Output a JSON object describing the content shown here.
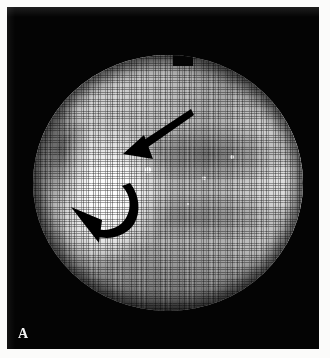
{
  "figure": {
    "panel_letter": "A",
    "caption_visible": false,
    "modality": "fiberoptic-endoscopy",
    "plate_background_color": "#040404",
    "page_background_color": "#fbfbfa"
  },
  "image_field": {
    "shape": "circle",
    "description": "Fiberoptic endoscopic view with visible honeycomb fiber-bundle mosaic",
    "top_notch": true,
    "tones": {
      "darkest": "#181818",
      "mid": "#a9a9a9",
      "bright_rim": "#ffffff",
      "hotspot": "#ffffff"
    }
  },
  "annotations": {
    "straight_arrow": {
      "name": "straight-arrow",
      "color": "#000000",
      "direction": "down-left",
      "tip": {
        "x": 131,
        "y": 149
      },
      "tail": {
        "x": 191,
        "y": 109
      }
    },
    "curved_arrow": {
      "name": "curved-arrow",
      "color": "#000000",
      "direction": "counter-clockwise, head up-left",
      "tip": {
        "x": 74,
        "y": 206
      },
      "tail": {
        "x": 130,
        "y": 189
      }
    }
  },
  "specular_points": [
    {
      "x": 148,
      "y": 170,
      "r": 3.0
    },
    {
      "x": 204,
      "y": 178,
      "r": 2.2
    },
    {
      "x": 232,
      "y": 157,
      "r": 2.0
    },
    {
      "x": 120,
      "y": 232,
      "r": 1.6
    },
    {
      "x": 188,
      "y": 204,
      "r": 1.4
    },
    {
      "x": 165,
      "y": 120,
      "r": 1.4
    }
  ]
}
